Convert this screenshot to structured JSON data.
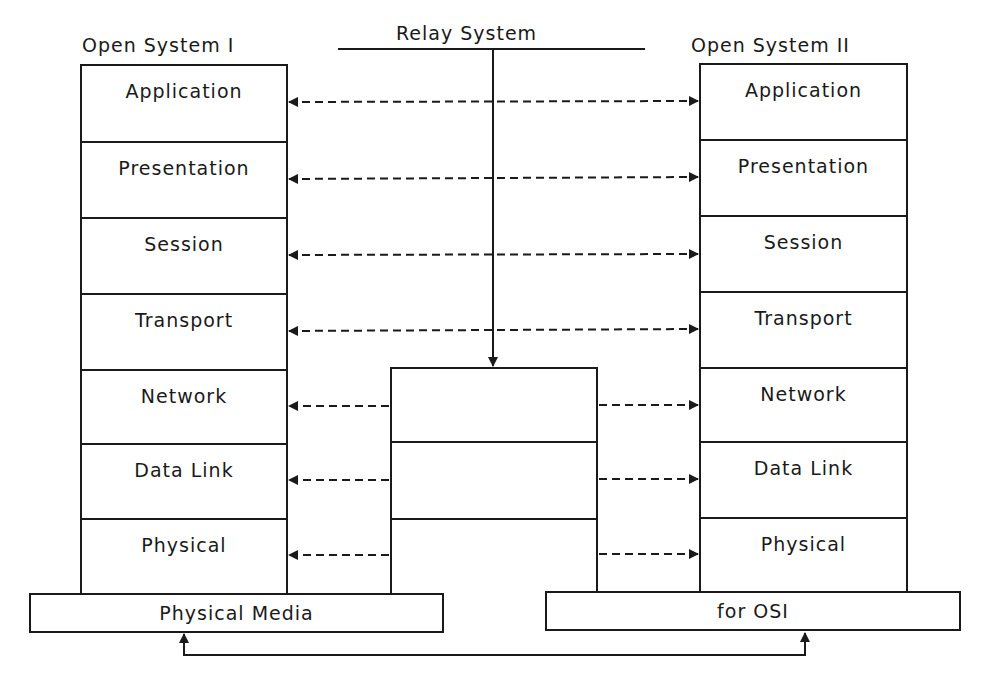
{
  "titles": {
    "left": "Open System I",
    "relay": "Relay System",
    "right": "Open System II"
  },
  "left_stack": {
    "layers": [
      "Application",
      "Presentation",
      "Session",
      "Transport",
      "Network",
      "Data Link",
      "Physical"
    ]
  },
  "right_stack": {
    "layers": [
      "Application",
      "Presentation",
      "Session",
      "Transport",
      "Network",
      "Data Link",
      "Physical"
    ]
  },
  "relay_stack": {
    "layers": [
      "",
      "",
      ""
    ]
  },
  "media": {
    "left_label": "Physical Media",
    "right_label": "for OSI"
  },
  "colors": {
    "line": "#1a1a1a",
    "background": "#ffffff"
  }
}
